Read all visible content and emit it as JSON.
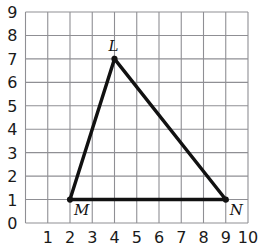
{
  "figure": {
    "title": "",
    "background_color": "#ffffff",
    "grid_color": "#8f8f94",
    "shape_color": "#111111",
    "label_color": "#1a1a1a"
  },
  "chart_data": {
    "type": "scatter",
    "title": "",
    "xlabel": "",
    "ylabel": "",
    "xlim": [
      0,
      10
    ],
    "ylim": [
      0,
      9
    ],
    "grid": true,
    "legend": null,
    "x_tick_labels": [
      "1",
      "2",
      "3",
      "4",
      "5",
      "6",
      "7",
      "8",
      "9",
      "10"
    ],
    "x_tick_values": [
      1,
      2,
      3,
      4,
      5,
      6,
      7,
      8,
      9,
      10
    ],
    "y_tick_labels": [
      "0",
      "1",
      "2",
      "3",
      "4",
      "5",
      "6",
      "7",
      "8",
      "9"
    ],
    "y_tick_values": [
      0,
      1,
      2,
      3,
      4,
      5,
      6,
      7,
      8,
      9
    ],
    "shape": {
      "name": "triangle",
      "closed": true,
      "vertices": [
        {
          "label": "M",
          "x": 2,
          "y": 1,
          "label_position": "below-right"
        },
        {
          "label": "L",
          "x": 4,
          "y": 7,
          "label_position": "above"
        },
        {
          "label": "N",
          "x": 9,
          "y": 1,
          "label_position": "below-right"
        }
      ],
      "edges": [
        {
          "from": "M",
          "to": "L"
        },
        {
          "from": "L",
          "to": "N"
        },
        {
          "from": "N",
          "to": "M"
        }
      ]
    }
  }
}
